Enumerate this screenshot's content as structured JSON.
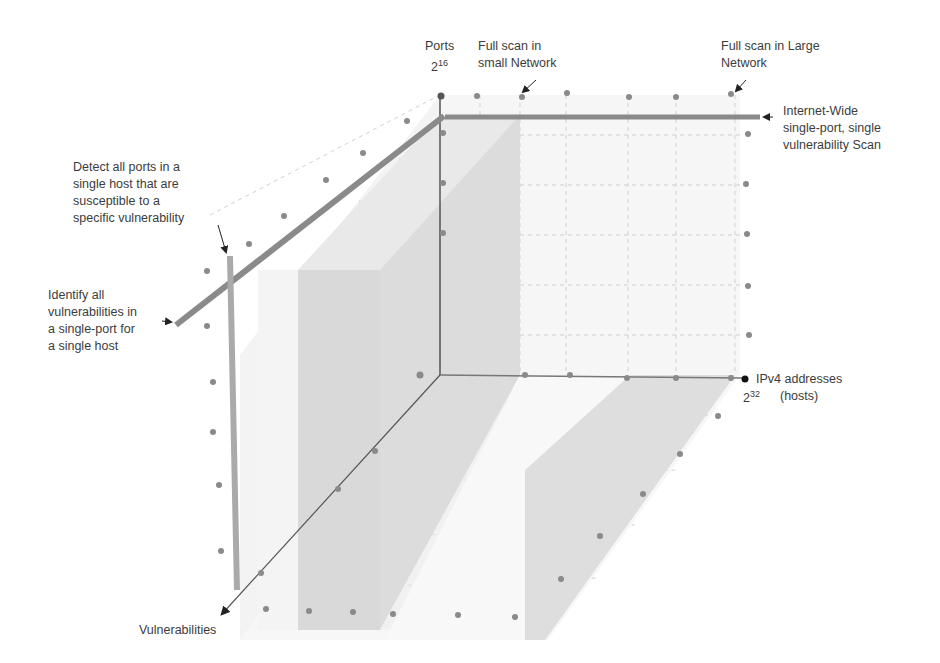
{
  "diagram": {
    "axes": {
      "ports": {
        "label": "Ports",
        "base": "2",
        "exponent": "16"
      },
      "hosts": {
        "label_line1": "IPv4 addresses",
        "label_line2": "(hosts)",
        "base": "2",
        "exponent": "32"
      },
      "vulnerabilities": {
        "label": "Vulnerabilities"
      }
    },
    "annotations": {
      "full_scan_small": {
        "lines": [
          "Full scan in",
          "small Network"
        ]
      },
      "full_scan_large": {
        "lines": [
          "Full scan in Large",
          "Network"
        ]
      },
      "internet_wide": {
        "lines": [
          "Internet-Wide",
          "single-port, single",
          "vulnerability Scan"
        ]
      },
      "detect_ports": {
        "lines": [
          "Detect all ports in a",
          "single host that are",
          "susceptible to a",
          "specific vulnerability"
        ]
      },
      "identify_vulns": {
        "lines": [
          "Identify all",
          "vulnerabilities in",
          "a single-port for",
          "a single host"
        ]
      }
    },
    "colors": {
      "axis": "#555555",
      "bar": "#8c8c8c",
      "bar_light": "#a9a9a9",
      "dot": "#8a8a8a",
      "grid": "#c8c8c8",
      "face_dark": "#d6d6d6",
      "face_mid": "#e4e4e4",
      "face_light": "#f1f1f1"
    }
  }
}
